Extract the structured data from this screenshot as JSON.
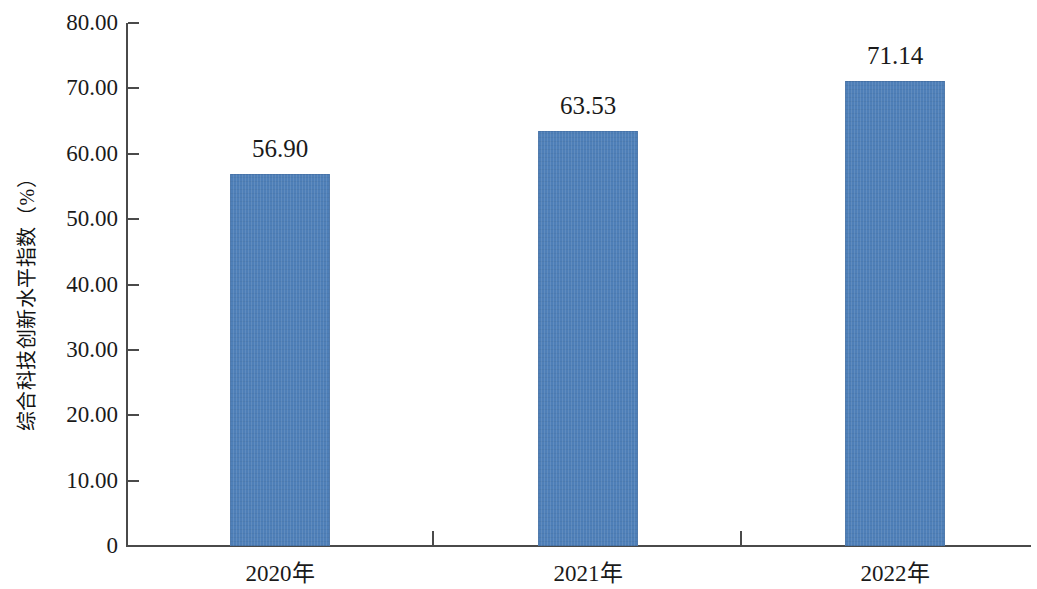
{
  "chart_data": {
    "type": "bar",
    "title": "",
    "subtitle": "",
    "xlabel": "",
    "ylabel": "综合科技创新水平指数（%）",
    "categories": [
      "2020年",
      "2021年",
      "2022年"
    ],
    "values": [
      56.9,
      63.53,
      71.14
    ],
    "value_labels": [
      "56.90",
      "63.53",
      "71.14"
    ],
    "ylim": [
      0,
      80
    ],
    "y_ticks": [
      0,
      10,
      20,
      30,
      40,
      50,
      60,
      70,
      80
    ],
    "y_tick_labels": [
      "0",
      "10.00",
      "20.00",
      "30.00",
      "40.00",
      "50.00",
      "60.00",
      "70.00",
      "80.00"
    ],
    "grid": false,
    "legend": false,
    "legend_position": "none",
    "series": [
      {
        "name": "综合科技创新水平指数",
        "values": [
          56.9,
          63.53,
          71.14
        ]
      }
    ],
    "colors": {
      "bar_fill": "#4e7fb8",
      "axis": "#4a4a4a",
      "text": "#1a1a1a",
      "background": "#ffffff"
    }
  }
}
